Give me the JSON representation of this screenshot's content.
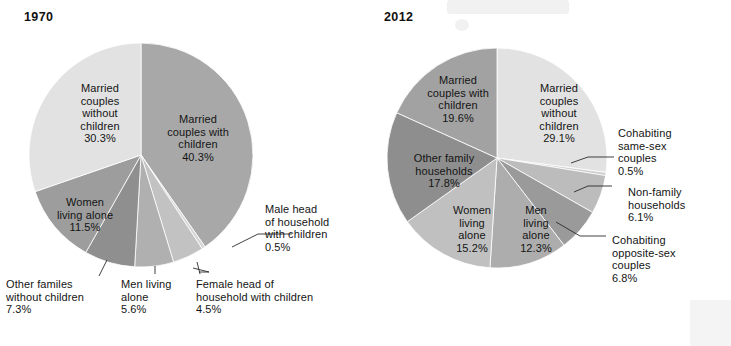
{
  "chart_data": [
    {
      "type": "pie",
      "title": "1970",
      "legend_position": "labels-on-slices",
      "start_angle_deg": 0,
      "direction": "clockwise",
      "categories": [
        "Married couples with children",
        "Male head of household with children",
        "Female head of household with children",
        "Men living alone",
        "Other familes without children",
        "Women living alone",
        "Married couples without children"
      ],
      "values": [
        40.3,
        0.5,
        4.5,
        5.6,
        7.3,
        11.5,
        30.3
      ],
      "unit": "%",
      "colors": [
        "#a8a8a8",
        "#d6d6d6",
        "#c2c2c2",
        "#b0b0b0",
        "#8f8f8f",
        "#9d9d9d",
        "#e2e2e2"
      ],
      "slices": [
        {
          "label": "Married couples with children",
          "value": 40.3,
          "value_label": "40.3%",
          "color": "#a8a8a8",
          "label_placement": "inside"
        },
        {
          "label": "Male head of household with children",
          "value": 0.5,
          "value_label": "0.5%",
          "color": "#d6d6d6",
          "label_placement": "callout-right"
        },
        {
          "label": "Female head of household with children",
          "value": 4.5,
          "value_label": "4.5%",
          "color": "#c2c2c2",
          "label_placement": "callout-bottom"
        },
        {
          "label": "Men living alone",
          "value": 5.6,
          "value_label": "5.6%",
          "color": "#b0b0b0",
          "label_placement": "callout-bottom"
        },
        {
          "label": "Other familes without children",
          "value": 7.3,
          "value_label": "7.3%",
          "color": "#8f8f8f",
          "label_placement": "callout-bottom"
        },
        {
          "label": "Women living alone",
          "value": 11.5,
          "value_label": "11.5%",
          "color": "#9d9d9d",
          "label_placement": "inside"
        },
        {
          "label": "Married couples without children",
          "value": 30.3,
          "value_label": "30.3%",
          "color": "#e2e2e2",
          "label_placement": "inside"
        }
      ]
    },
    {
      "type": "pie",
      "title": "2012",
      "legend_position": "labels-on-slices",
      "start_angle_deg": 0,
      "direction": "clockwise",
      "categories": [
        "Married couples without children",
        "Cohabiting same-sex couples",
        "Non-family households",
        "Cohabiting opposite-sex couples",
        "Men living alone",
        "Women living alone",
        "Other family households",
        "Married couples with children"
      ],
      "values": [
        29.1,
        0.5,
        6.1,
        6.8,
        12.3,
        15.2,
        17.8,
        19.6
      ],
      "unit": "%",
      "colors": [
        "#e2e2e2",
        "#cfcfcf",
        "#bcbcbc",
        "#9a9a9a",
        "#adadad",
        "#c0c0c0",
        "#8e8e8e",
        "#a2a2a2"
      ],
      "slices": [
        {
          "label": "Married couples without children",
          "value": 29.1,
          "value_label": "29.1%",
          "color": "#e2e2e2",
          "label_placement": "inside"
        },
        {
          "label": "Cohabiting same-sex couples",
          "value": 0.5,
          "value_label": "0.5%",
          "color": "#cfcfcf",
          "label_placement": "callout-right"
        },
        {
          "label": "Non-family households",
          "value": 6.1,
          "value_label": "6.1%",
          "color": "#bcbcbc",
          "label_placement": "callout-right"
        },
        {
          "label": "Cohabiting opposite-sex couples",
          "value": 6.8,
          "value_label": "6.8%",
          "color": "#9a9a9a",
          "label_placement": "callout-right"
        },
        {
          "label": "Men living alone",
          "value": 12.3,
          "value_label": "12.3%",
          "color": "#adadad",
          "label_placement": "inside"
        },
        {
          "label": "Women living alone",
          "value": 15.2,
          "value_label": "15.2%",
          "color": "#c0c0c0",
          "label_placement": "inside"
        },
        {
          "label": "Other family households",
          "value": 17.8,
          "value_label": "17.8%",
          "color": "#8e8e8e",
          "label_placement": "inside"
        },
        {
          "label": "Married couples with children",
          "value": 19.6,
          "value_label": "19.6%",
          "color": "#a2a2a2",
          "label_placement": "inside"
        }
      ]
    }
  ],
  "chart_1970": {
    "title": "1970",
    "labels": {
      "married_couples_without_children": "Married\ncouples\nwithout\nchildren\n30.3%",
      "married_couples_with_children": "Married\ncouples with\nchildren\n40.3%",
      "women_living_alone": "Women\nliving alone\n11.5%",
      "other_familes_without_children": "Other familes\nwithout children\n7.3%",
      "men_living_alone": "Men living\nalone\n5.6%",
      "female_head_of_household": "Female head of\nhousehold with children\n4.5%",
      "male_head_of_household": "Male head\nof household\nwith children\n0.5%"
    }
  },
  "chart_2012": {
    "title": "2012",
    "labels": {
      "married_couples_with_children": "Married\ncouples with\nchildren\n19.6%",
      "married_couples_without_children": "Married\ncouples\nwithout\nchildren\n29.1%",
      "other_family_households": "Other family\nhouseholds\n17.8%",
      "women_living_alone": "Women\nliving\nalone\n15.2%",
      "men_living_alone": "Men\nliving\nalone\n12.3%",
      "cohabiting_same_sex_couples": "Cohabiting\nsame-sex\ncouples\n0.5%",
      "non_family_households": "Non-family\nhouseholds\n6.1%",
      "cohabiting_opposite_sex_couples": "Cohabiting\nopposite-sex\ncouples\n6.8%"
    }
  }
}
